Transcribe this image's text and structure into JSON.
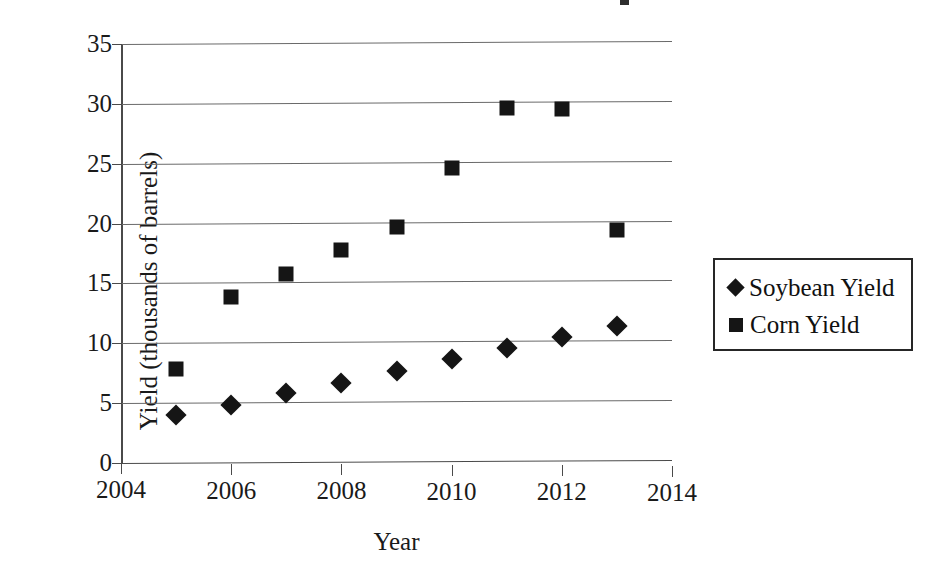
{
  "chart_data": {
    "type": "scatter",
    "title": "",
    "xlabel": "Year",
    "ylabel": "Yield (thousands of barrels)",
    "x": [
      2005,
      2006,
      2007,
      2008,
      2009,
      2010,
      2011,
      2012,
      2013
    ],
    "xlim": [
      2004,
      2014
    ],
    "ylim": [
      0,
      35
    ],
    "xticks": [
      "2004",
      "2006",
      "2008",
      "2010",
      "2012",
      "2014"
    ],
    "xtick_values": [
      2004,
      2006,
      2008,
      2010,
      2012,
      2014
    ],
    "yticks": [
      "0",
      "5",
      "10",
      "15",
      "20",
      "25",
      "30",
      "35"
    ],
    "ytick_values": [
      0,
      5,
      10,
      15,
      20,
      25,
      30,
      35
    ],
    "grid": "horizontal",
    "legend_position": "right",
    "series": [
      {
        "name": "Soybean Yield",
        "marker": "diamond",
        "color": "#151515",
        "values": [
          4.0,
          4.9,
          5.9,
          6.8,
          7.8,
          8.8,
          9.8,
          10.7,
          11.7
        ]
      },
      {
        "name": "Corn Yield",
        "marker": "square",
        "color": "#151515",
        "values": [
          7.9,
          13.9,
          15.9,
          17.9,
          19.8,
          24.8,
          29.8,
          29.8,
          19.7
        ]
      }
    ]
  },
  "legend": {
    "entries": [
      {
        "label": "Soybean Yield",
        "marker": "diamond"
      },
      {
        "label": "Corn Yield",
        "marker": "square"
      }
    ]
  },
  "axes": {
    "x_title": "Year",
    "y_title": "Yield (thousands of barrels)"
  }
}
